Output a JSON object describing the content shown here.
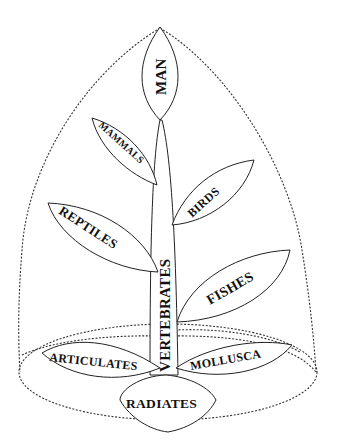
{
  "diagram": {
    "type": "tree-of-life-leaf-diagram",
    "outline_style": "dotted",
    "stem": {
      "label": "VERTEBRATES"
    },
    "top": {
      "label": "MAN"
    },
    "branches": [
      {
        "label": "MAMMALS",
        "side": "left"
      },
      {
        "label": "BIRDS",
        "side": "right"
      },
      {
        "label": "REPTILES",
        "side": "left"
      },
      {
        "label": "FISHES",
        "side": "right"
      }
    ],
    "base": [
      {
        "label": "ARTICULATES",
        "side": "left"
      },
      {
        "label": "MOLLUSCA",
        "side": "right"
      },
      {
        "label": "RADIATES",
        "side": "bottom"
      }
    ],
    "colors": {
      "ink": "#111111",
      "background": "#ffffff"
    }
  }
}
